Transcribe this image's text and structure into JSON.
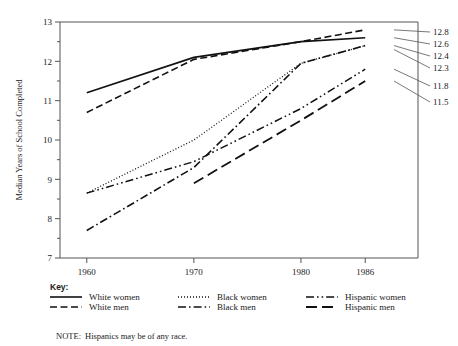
{
  "chart_data": {
    "type": "line",
    "title": "",
    "xlabel": "",
    "ylabel": "Median Years of School Completed",
    "x": [
      1960,
      1970,
      1980,
      1986
    ],
    "xtick_labels": [
      "1960",
      "1970",
      "1980",
      "1986"
    ],
    "xlim": [
      1957.5,
      1988.5
    ],
    "ylim": [
      7,
      13
    ],
    "ytick_labels": [
      "7",
      "8",
      "9",
      "10",
      "11",
      "12",
      "13"
    ],
    "yticks": [
      7,
      8,
      9,
      10,
      11,
      12,
      13
    ],
    "yminor_step": 0.5,
    "grid": false,
    "legend_position": "below-plot",
    "note": "Hispanics may be of any race.",
    "note_prefix": "NOTE:",
    "key_title": "Key:",
    "series": [
      {
        "name": "White women",
        "dash": "none",
        "x": [
          1960,
          1970,
          1980,
          1986
        ],
        "values": [
          11.2,
          12.1,
          12.5,
          12.6
        ],
        "end_label": "12.6"
      },
      {
        "name": "White men",
        "dash": "dashed",
        "x": [
          1960,
          1970,
          1980,
          1986
        ],
        "values": [
          10.7,
          12.05,
          12.5,
          12.8
        ],
        "end_label": "12.8"
      },
      {
        "name": "Black women",
        "dash": "dotted",
        "x": [
          1960,
          1970,
          1980,
          1986
        ],
        "values": [
          8.65,
          10.0,
          11.95,
          12.4
        ],
        "end_label": "12.4"
      },
      {
        "name": "Black men",
        "dash": "dash-dot",
        "x": [
          1960,
          1970,
          1980,
          1986
        ],
        "values": [
          7.7,
          9.3,
          11.95,
          12.4
        ],
        "end_label": "12.3"
      },
      {
        "name": "Hispanic women",
        "dash": "dash-dot-dot",
        "x": [
          1960,
          1970,
          1980,
          1986
        ],
        "values": [
          8.65,
          9.45,
          10.8,
          11.8
        ],
        "end_label": "11.8"
      },
      {
        "name": "Hispanic men",
        "dash": "long-dash",
        "x": [
          1970,
          1980,
          1986
        ],
        "values": [
          8.9,
          10.5,
          11.5
        ],
        "end_label": "11.5"
      }
    ],
    "end_labels": [
      {
        "text": "12.8",
        "value": 12.8
      },
      {
        "text": "12.6",
        "value": 12.6
      },
      {
        "text": "12.4",
        "value": 12.4
      },
      {
        "text": "12.3",
        "value": 12.3
      },
      {
        "text": "11.8",
        "value": 11.8
      },
      {
        "text": "11.5",
        "value": 11.5
      }
    ]
  },
  "legend": {
    "title": "Key:",
    "rows": [
      [
        {
          "label": "White women",
          "dash": "none"
        },
        {
          "label": "Black women",
          "dash": "dotted"
        },
        {
          "label": "Hispanic women",
          "dash": "dash-dot-dot"
        }
      ],
      [
        {
          "label": "White men",
          "dash": "dashed"
        },
        {
          "label": "Black men",
          "dash": "dash-dot"
        },
        {
          "label": "Hispanic men",
          "dash": "long-dash"
        }
      ]
    ]
  },
  "footnote": {
    "prefix": "NOTE:",
    "text": "Hispanics may be of any race."
  }
}
